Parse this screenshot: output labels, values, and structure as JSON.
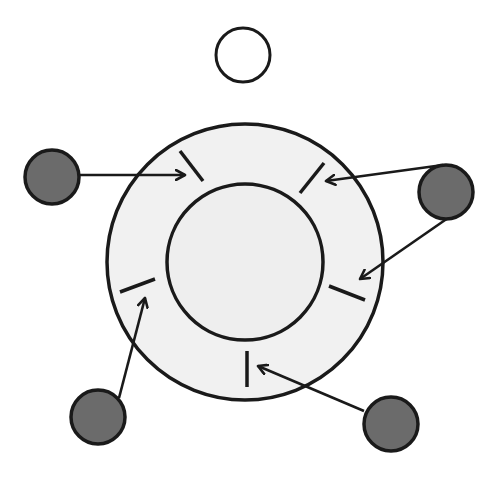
{
  "diagram": {
    "title": "",
    "colors": {
      "background": "#ffffff",
      "stroke": "#1a1a1a",
      "outer_ring_fill": "#f1f1f1",
      "inner_core_fill": "#eeeeee",
      "particle_fill": "#6b6b6b",
      "free_particle_fill": "#ffffff"
    },
    "outer_circle": {
      "cx": 245,
      "cy": 262,
      "r": 138
    },
    "inner_circle": {
      "cx": 245,
      "cy": 262,
      "r": 78
    },
    "free_particle": {
      "id": "top-white",
      "cx": 243,
      "cy": 55,
      "r": 27
    },
    "particles": [
      {
        "id": "left",
        "cx": 52,
        "cy": 177,
        "r": 27
      },
      {
        "id": "right",
        "cx": 446,
        "cy": 192,
        "r": 27
      },
      {
        "id": "bottom-left",
        "cx": 98,
        "cy": 417,
        "r": 27
      },
      {
        "id": "bottom-right",
        "cx": 391,
        "cy": 424,
        "r": 27
      }
    ],
    "receptor_ticks": [
      {
        "id": "top-left",
        "x1": 180,
        "y1": 151,
        "x2": 203,
        "y2": 181
      },
      {
        "id": "top-right",
        "x1": 324,
        "y1": 163,
        "x2": 300,
        "y2": 193
      },
      {
        "id": "right-lower",
        "x1": 329,
        "y1": 286,
        "x2": 365,
        "y2": 300
      },
      {
        "id": "left-lower",
        "x1": 120,
        "y1": 292,
        "x2": 155,
        "y2": 279
      },
      {
        "id": "bottom",
        "x1": 247,
        "y1": 351,
        "x2": 247,
        "y2": 387
      }
    ],
    "arrows": [
      {
        "id": "left-to-top-left",
        "from": "left",
        "x1": 80,
        "y1": 175,
        "x2": 185,
        "y2": 175
      },
      {
        "id": "right-to-top-right",
        "from": "right",
        "x1": 443,
        "y1": 165,
        "x2": 326,
        "y2": 181
      },
      {
        "id": "right-to-right-lower",
        "from": "right",
        "x1": 448,
        "y1": 218,
        "x2": 360,
        "y2": 279
      },
      {
        "id": "bottom-left-to-left-lower",
        "from": "bottom-left",
        "x1": 119,
        "y1": 398,
        "x2": 145,
        "y2": 298
      },
      {
        "id": "bottom-right-to-bottom",
        "from": "bottom-right",
        "x1": 364,
        "y1": 411,
        "x2": 258,
        "y2": 366
      }
    ]
  }
}
